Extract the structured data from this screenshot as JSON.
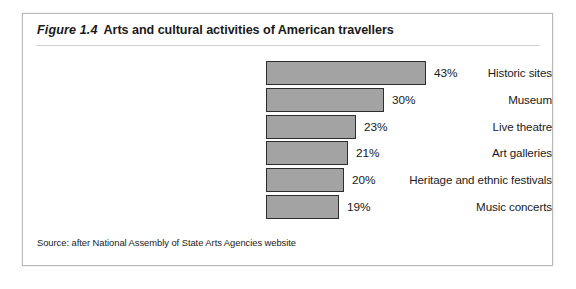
{
  "figure": {
    "number": "Figure 1.4",
    "title": "Arts and cultural activities of American travellers",
    "source": "Source: after National Assembly of State Arts Agencies website",
    "bar_fill_color": "#a3a3a3",
    "bar_border_color": "#2e2e2e",
    "frame_border_color": "#b9b9b9"
  },
  "chart_data": {
    "type": "bar",
    "orientation": "horizontal",
    "title": "Arts and cultural activities of American travellers",
    "xlabel": "",
    "ylabel": "",
    "grid": false,
    "legend": null,
    "value_suffix": "%",
    "categories": [
      "Historic sites",
      "Museum",
      "Live theatre",
      "Art galleries",
      "Heritage and ethnic festivals",
      "Music concerts"
    ],
    "values": [
      43,
      30,
      23,
      21,
      20,
      19
    ],
    "value_labels": [
      "43%",
      "30%",
      "23%",
      "21%",
      "20%",
      "19%"
    ],
    "bar_pixel_widths": [
      160,
      118,
      90,
      82,
      78,
      73
    ],
    "xlim": [
      0,
      50
    ]
  }
}
